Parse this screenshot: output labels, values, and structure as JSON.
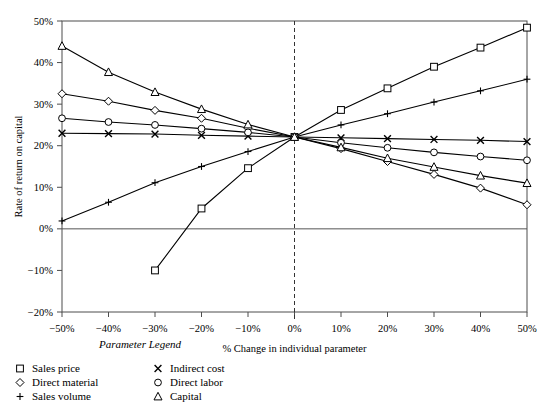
{
  "chart_data": {
    "type": "line",
    "title": "",
    "xlabel": "% Change in individual parameter",
    "ylabel": "Rate of return on capital",
    "x": [
      -50,
      -40,
      -30,
      -20,
      -10,
      0,
      10,
      20,
      30,
      40,
      50
    ],
    "xtick_labels": [
      "−50%",
      "−40%",
      "−30%",
      "−20%",
      "−10%",
      "0%",
      "10%",
      "20%",
      "30%",
      "40%",
      "50%"
    ],
    "ytick_labels": [
      "−20%",
      "−10%",
      "0%",
      "10%",
      "20%",
      "30%",
      "40%",
      "50%"
    ],
    "yticks": [
      -20,
      -10,
      0,
      10,
      20,
      30,
      40,
      50
    ],
    "xlim": [
      -50,
      50
    ],
    "ylim": [
      -20,
      50
    ],
    "grid": false,
    "legend_position": "below-left",
    "legend_title": "Parameter Legend",
    "annotations": [
      {
        "name": "zero-vertical-reference",
        "x": 0,
        "style": "dashed"
      },
      {
        "name": "zero-horizontal-reference",
        "y": 0,
        "style": "solid"
      }
    ],
    "series": [
      {
        "name": "Sales price",
        "marker": "square",
        "x": [
          -30,
          -20,
          -10,
          0,
          10,
          20,
          30,
          40,
          50
        ],
        "values": [
          -10.0,
          4.9,
          14.6,
          22.1,
          28.6,
          33.8,
          39.0,
          43.6,
          48.4
        ]
      },
      {
        "name": "Direct material",
        "marker": "diamond",
        "x": [
          -50,
          -40,
          -30,
          -20,
          -10,
          0,
          10,
          20,
          30,
          40,
          50
        ],
        "values": [
          32.5,
          30.7,
          28.5,
          26.6,
          24.2,
          22.1,
          19.3,
          16.2,
          13.1,
          9.8,
          5.8
        ]
      },
      {
        "name": "Sales volume",
        "marker": "plus",
        "x": [
          -50,
          -40,
          -30,
          -20,
          -10,
          0,
          10,
          20,
          30,
          40,
          50
        ],
        "values": [
          1.9,
          6.4,
          11.1,
          15.0,
          18.6,
          22.1,
          25.0,
          27.7,
          30.5,
          33.2,
          36.0
        ]
      },
      {
        "name": "Indirect cost",
        "marker": "x",
        "x": [
          -50,
          -40,
          -30,
          -20,
          -10,
          0,
          10,
          20,
          30,
          40,
          50
        ],
        "values": [
          23.0,
          22.9,
          22.8,
          22.5,
          22.3,
          22.1,
          21.9,
          21.7,
          21.5,
          21.3,
          21.0
        ]
      },
      {
        "name": "Direct labor",
        "marker": "circle",
        "x": [
          -50,
          -40,
          -30,
          -20,
          -10,
          0,
          10,
          20,
          30,
          40,
          50
        ],
        "values": [
          26.6,
          25.7,
          25.0,
          24.1,
          23.2,
          22.1,
          20.7,
          19.5,
          18.4,
          17.4,
          16.5
        ]
      },
      {
        "name": "Capital",
        "marker": "triangle",
        "x": [
          -50,
          -40,
          -30,
          -20,
          -10,
          0,
          10,
          20,
          30,
          40,
          50
        ],
        "values": [
          44.0,
          37.7,
          32.9,
          28.8,
          25.1,
          22.1,
          19.6,
          17.0,
          14.9,
          12.8,
          11.0
        ]
      }
    ]
  },
  "legend": {
    "title": "Parameter Legend",
    "entries": [
      {
        "label": "Sales price",
        "marker": "square"
      },
      {
        "label": "Direct material",
        "marker": "diamond"
      },
      {
        "label": "Sales volume",
        "marker": "plus"
      },
      {
        "label": "Indirect cost",
        "marker": "x"
      },
      {
        "label": "Direct labor",
        "marker": "circle"
      },
      {
        "label": "Capital",
        "marker": "triangle"
      }
    ]
  }
}
